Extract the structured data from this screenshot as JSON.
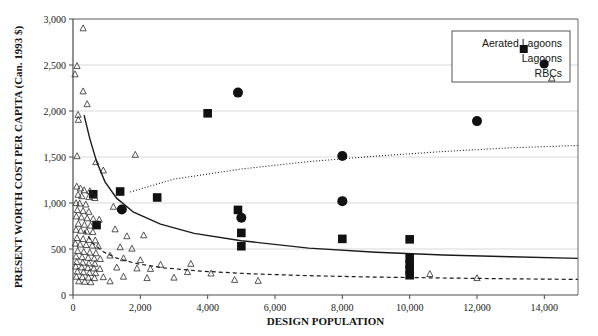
{
  "chart_data": {
    "type": "scatter",
    "title": "",
    "xlabel": "DESIGN POPULATION",
    "ylabel": "PRESENT WORTH COST PER CAPITA (Can. 1993 $)",
    "xlim": [
      0,
      15000
    ],
    "ylim": [
      0,
      3000
    ],
    "xticks": [
      0,
      2000,
      4000,
      6000,
      8000,
      10000,
      12000,
      14000
    ],
    "xticklabels": [
      "0",
      "2,000",
      "4,000",
      "6,000",
      "8,000",
      "10,000",
      "12,000",
      "14,000"
    ],
    "yticks": [
      0,
      500,
      1000,
      1500,
      2000,
      2500,
      3000
    ],
    "yticklabels": [
      "0",
      "500",
      "1,000",
      "1,500",
      "2,000",
      "2,500",
      "3,000"
    ],
    "grid": "horizontal",
    "legend_position": "top-right",
    "legend": [
      {
        "label": "Aerated Lagoons",
        "marker": "filled-square",
        "curve": "dotted"
      },
      {
        "label": "Lagoons",
        "marker": "filled-circle",
        "curve": "solid"
      },
      {
        "label": "RBCs",
        "marker": "open-triangle",
        "curve": "dashed"
      }
    ],
    "series": [
      {
        "name": "Aerated Lagoons",
        "marker": "filled-square",
        "points": [
          [
            600,
            1095
          ],
          [
            700,
            760
          ],
          [
            1400,
            1125
          ],
          [
            2500,
            1060
          ],
          [
            4000,
            1975
          ],
          [
            4900,
            925
          ],
          [
            5000,
            675
          ],
          [
            5000,
            530
          ],
          [
            8000,
            610
          ],
          [
            10000,
            605
          ],
          [
            10000,
            400
          ],
          [
            10000,
            330
          ],
          [
            10000,
            270
          ],
          [
            10000,
            215
          ]
        ]
      },
      {
        "name": "Lagoons",
        "marker": "filled-circle",
        "points": [
          [
            1450,
            930
          ],
          [
            4900,
            2200
          ],
          [
            5000,
            840
          ],
          [
            8000,
            1510
          ],
          [
            8000,
            1020
          ],
          [
            12000,
            1890
          ]
        ]
      },
      {
        "name": "RBCs",
        "marker": "open-triangle",
        "points": [
          [
            300,
            2900
          ],
          [
            120,
            2490
          ],
          [
            60,
            2400
          ],
          [
            300,
            2215
          ],
          [
            420,
            2075
          ],
          [
            150,
            1960
          ],
          [
            160,
            1905
          ],
          [
            120,
            1510
          ],
          [
            1850,
            1525
          ],
          [
            900,
            1355
          ],
          [
            680,
            1445
          ],
          [
            110,
            1180
          ],
          [
            220,
            1160
          ],
          [
            330,
            1140
          ],
          [
            500,
            1130
          ],
          [
            150,
            1090
          ],
          [
            260,
            1075
          ],
          [
            470,
            1065
          ],
          [
            650,
            1055
          ],
          [
            90,
            1000
          ],
          [
            200,
            995
          ],
          [
            380,
            985
          ],
          [
            130,
            925
          ],
          [
            300,
            915
          ],
          [
            470,
            905
          ],
          [
            1200,
            960
          ],
          [
            100,
            855
          ],
          [
            250,
            845
          ],
          [
            420,
            835
          ],
          [
            600,
            828
          ],
          [
            780,
            820
          ],
          [
            160,
            775
          ],
          [
            340,
            765
          ],
          [
            520,
            755
          ],
          [
            90,
            710
          ],
          [
            230,
            700
          ],
          [
            410,
            690
          ],
          [
            590,
            685
          ],
          [
            1250,
            715
          ],
          [
            1600,
            640
          ],
          [
            2100,
            650
          ],
          [
            120,
            620
          ],
          [
            300,
            610
          ],
          [
            480,
            600
          ],
          [
            660,
            595
          ],
          [
            70,
            560
          ],
          [
            210,
            550
          ],
          [
            390,
            545
          ],
          [
            570,
            538
          ],
          [
            750,
            530
          ],
          [
            1400,
            520
          ],
          [
            1750,
            505
          ],
          [
            140,
            480
          ],
          [
            320,
            470
          ],
          [
            500,
            462
          ],
          [
            680,
            455
          ],
          [
            90,
            420
          ],
          [
            270,
            412
          ],
          [
            450,
            405
          ],
          [
            630,
            398
          ],
          [
            810,
            392
          ],
          [
            1100,
            430
          ],
          [
            1500,
            400
          ],
          [
            2000,
            380
          ],
          [
            110,
            360
          ],
          [
            290,
            352
          ],
          [
            470,
            345
          ],
          [
            650,
            340
          ],
          [
            2600,
            330
          ],
          [
            3500,
            340
          ],
          [
            80,
            310
          ],
          [
            260,
            302
          ],
          [
            440,
            296
          ],
          [
            620,
            290
          ],
          [
            800,
            285
          ],
          [
            1300,
            300
          ],
          [
            1900,
            290
          ],
          [
            2300,
            285
          ],
          [
            130,
            255
          ],
          [
            310,
            248
          ],
          [
            490,
            242
          ],
          [
            670,
            238
          ],
          [
            3400,
            250
          ],
          [
            4100,
            235
          ],
          [
            100,
            200
          ],
          [
            280,
            195
          ],
          [
            460,
            190
          ],
          [
            640,
            185
          ],
          [
            900,
            195
          ],
          [
            1500,
            200
          ],
          [
            2200,
            185
          ],
          [
            3000,
            190
          ],
          [
            170,
            150
          ],
          [
            350,
            145
          ],
          [
            530,
            140
          ],
          [
            1100,
            150
          ],
          [
            4800,
            165
          ],
          [
            5500,
            155
          ],
          [
            10600,
            230
          ],
          [
            12000,
            185
          ]
        ]
      }
    ],
    "trend_curves": [
      {
        "name": "Aerated Lagoons",
        "style": "dotted",
        "points": [
          [
            1700,
            1120
          ],
          [
            3000,
            1260
          ],
          [
            5000,
            1370
          ],
          [
            7000,
            1450
          ],
          [
            9000,
            1510
          ],
          [
            11000,
            1560
          ],
          [
            13000,
            1600
          ],
          [
            15000,
            1625
          ]
        ]
      },
      {
        "name": "Lagoons",
        "style": "solid",
        "points": [
          [
            330,
            1955
          ],
          [
            500,
            1700
          ],
          [
            700,
            1450
          ],
          [
            950,
            1230
          ],
          [
            1300,
            1050
          ],
          [
            1800,
            900
          ],
          [
            2600,
            770
          ],
          [
            3600,
            670
          ],
          [
            5000,
            590
          ],
          [
            7000,
            510
          ],
          [
            9000,
            465
          ],
          [
            11000,
            435
          ],
          [
            13000,
            415
          ],
          [
            15000,
            398
          ]
        ]
      },
      {
        "name": "RBCs",
        "style": "dashed",
        "points": [
          [
            330,
            700
          ],
          [
            600,
            560
          ],
          [
            900,
            470
          ],
          [
            1300,
            400
          ],
          [
            1900,
            340
          ],
          [
            2700,
            295
          ],
          [
            3800,
            260
          ],
          [
            5200,
            232
          ],
          [
            7000,
            210
          ],
          [
            9000,
            195
          ],
          [
            11000,
            185
          ],
          [
            13000,
            176
          ],
          [
            15000,
            170
          ]
        ]
      }
    ]
  }
}
